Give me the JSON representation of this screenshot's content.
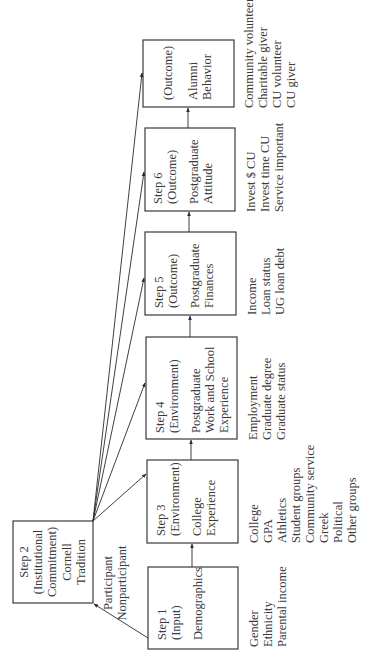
{
  "diagram": {
    "orientation": "rotated-90-ccw",
    "nodes": [
      {
        "id": "step2",
        "lines": [
          "Step 2",
          "(Institutional",
          "Commitment)",
          "Cornell",
          "Tradition"
        ],
        "attributes": [
          "Participant",
          "Nonparticipant"
        ]
      },
      {
        "id": "step1",
        "lines": [
          "Step 1",
          "(Input)",
          "Demographics"
        ],
        "attributes": [
          "Gender",
          "Ethnicity",
          "Parental income"
        ]
      },
      {
        "id": "step3",
        "lines": [
          "Step 3",
          "(Environment)",
          "College",
          "Experience"
        ],
        "attributes": [
          "College",
          "GPA",
          "Athletics",
          "Student groups",
          "Community service",
          "Greek",
          "Political",
          "Other groups"
        ]
      },
      {
        "id": "step4",
        "lines": [
          "Step 4",
          "(Environment)",
          "Postgraduate",
          "Work and School",
          "Experience"
        ],
        "attributes": [
          "Employment",
          "Graduate degree",
          "Graduate status"
        ]
      },
      {
        "id": "step5",
        "lines": [
          "Step 5",
          "(Outcome)",
          "Postgraduate",
          "Finances"
        ],
        "attributes": [
          "Income",
          "Loan status",
          "UG loan debt"
        ]
      },
      {
        "id": "step6",
        "lines": [
          "Step 6",
          "(Outcome)",
          "Postgraduate",
          "Attitude"
        ],
        "attributes": [
          "Invest $ CU",
          "Invest time CU",
          "Service important"
        ]
      },
      {
        "id": "outcome",
        "lines": [
          "(Outcome)",
          "Alumni",
          "Behavior"
        ],
        "attributes": [
          "Community volunteer",
          "Charitable giver",
          "CU volunteer",
          "CU giver"
        ]
      }
    ],
    "edges": [
      {
        "from": "step1",
        "to": "step2"
      },
      {
        "from": "step1",
        "to": "step3"
      },
      {
        "from": "step3",
        "to": "step4"
      },
      {
        "from": "step4",
        "to": "step5"
      },
      {
        "from": "step5",
        "to": "step6"
      },
      {
        "from": "step6",
        "to": "outcome"
      },
      {
        "from": "step2",
        "to": "step3"
      },
      {
        "from": "step2",
        "to": "step4"
      },
      {
        "from": "step2",
        "to": "step5"
      },
      {
        "from": "step2",
        "to": "step6"
      },
      {
        "from": "step2",
        "to": "outcome"
      }
    ]
  }
}
